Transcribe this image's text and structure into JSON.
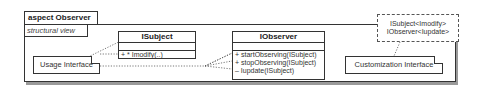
{
  "aspect": {
    "title": "aspect Observer",
    "view_label": "structural view"
  },
  "classes": [
    {
      "name": "ISubject",
      "operations": [
        "+ * Imodify(..)"
      ]
    },
    {
      "name": "IObserver",
      "operations": [
        "+ startObserving(ISubject)",
        "+ stopObserving(ISubject)",
        "– Iupdate(ISubject)"
      ]
    }
  ],
  "notes": {
    "usage": "Usage Interface",
    "customization": "Customization Interface"
  },
  "template_parameters": [
    "ISubject<Imodify>",
    "IObserver<Iupdate>"
  ]
}
